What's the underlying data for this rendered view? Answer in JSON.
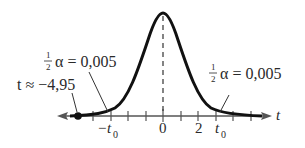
{
  "diagram": {
    "axis_label": "t",
    "tick_labels": {
      "zero": "0",
      "two": "2",
      "neg_t0": "−t",
      "neg_t0_sub": "0",
      "t0": "t",
      "t0_sub": "0"
    },
    "left_annotation": {
      "fraction_num": "1",
      "fraction_den": "2",
      "text": "α = 0,005"
    },
    "right_annotation": {
      "fraction_num": "1",
      "fraction_den": "2",
      "text": "α = 0,005"
    },
    "point_annotation": "t ≈ −4,95",
    "colors": {
      "curve": "#111111",
      "axis": "#555555",
      "text": "#2a2a2a"
    }
  }
}
